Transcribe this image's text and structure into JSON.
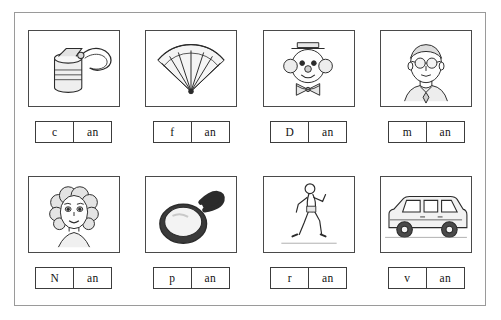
{
  "worksheet": {
    "title": "short a -an word family picture cards",
    "items": [
      {
        "picture": "can-opener-with-open-tin-can",
        "onset": "c",
        "rime": "an"
      },
      {
        "picture": "hand-fan",
        "onset": "f",
        "rime": "an"
      },
      {
        "picture": "clown-face",
        "onset": "D",
        "rime": "an"
      },
      {
        "picture": "man-face-with-glasses",
        "onset": "m",
        "rime": "an"
      },
      {
        "picture": "girl-face-with-curly-hair",
        "onset": "N",
        "rime": "an"
      },
      {
        "picture": "frying-pan",
        "onset": "p",
        "rime": "an"
      },
      {
        "picture": "running-person",
        "onset": "r",
        "rime": "an"
      },
      {
        "picture": "van-vehicle",
        "onset": "v",
        "rime": "an"
      }
    ]
  }
}
